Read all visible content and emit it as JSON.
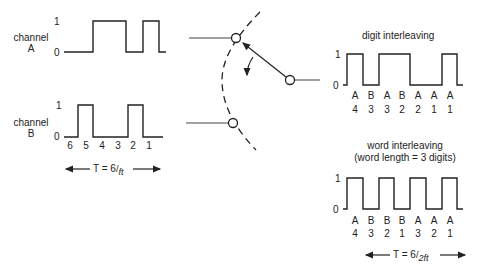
{
  "diagram": {
    "type": "time-division multiplexing — digit vs word interleaving",
    "channel_a": {
      "label_line1": "channel",
      "label_line2": "A",
      "level_high": "1",
      "level_low": "0",
      "bits": [
        0,
        1,
        1,
        0,
        1,
        0
      ]
    },
    "channel_b": {
      "label_line1": "channel",
      "label_line2": "B",
      "level_high": "1",
      "level_low": "0",
      "bits": [
        0,
        1,
        0,
        0,
        1,
        0
      ],
      "digit_positions": [
        "6",
        "5",
        "4",
        "3",
        "2",
        "1"
      ],
      "period_label_prefix": "T = 6",
      "period_label_denominator": "ft"
    },
    "switch": {
      "description": "rotary commutator switching between channel A and channel B contacts",
      "contacts": [
        "channel A contact",
        "channel B contact"
      ],
      "rotation": "clockwise"
    },
    "digit_interleaving": {
      "title": "digit interleaving",
      "level_high": "1",
      "level_low": "0",
      "channels": [
        "A",
        "B",
        "A",
        "B",
        "A",
        "A",
        "A"
      ],
      "digits": [
        "4",
        "3",
        "3",
        "2",
        "2",
        "1",
        "1"
      ]
    },
    "word_interleaving": {
      "title": "word interleaving",
      "subtitle": "(word length = 3 digits)",
      "level_high": "1",
      "level_low": "0",
      "channels": [
        "A",
        "B",
        "B",
        "B",
        "A",
        "A",
        "A"
      ],
      "digits": [
        "4",
        "3",
        "2",
        "1",
        "3",
        "2",
        "1"
      ],
      "period_label_prefix": "T = 6",
      "period_label_denominator": "2ft"
    }
  }
}
